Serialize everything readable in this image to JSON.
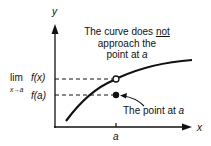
{
  "diagram": {
    "axes": {
      "x_label": "x",
      "y_label": "y"
    },
    "x_tick_label": "a",
    "limit_label": {
      "lim": "lim",
      "sub": "x→a",
      "fx": "f(x)"
    },
    "fa_label": "f(a)",
    "annotation_top": {
      "line1_pre": "The curve does ",
      "line1_emph": "not",
      "line2": "approach the",
      "line3_pre": "point at ",
      "line3_var": "a"
    },
    "annotation_bottom": {
      "text_pre": "The point at ",
      "text_var": "a"
    },
    "points": [
      {
        "name": "limit-point",
        "style": "open-circle",
        "x": "a",
        "y": "lim f(x)"
      },
      {
        "name": "function-value-point",
        "style": "filled-circle",
        "x": "a",
        "y": "f(a)"
      }
    ],
    "colors": {
      "ink": "#111111",
      "background": "#ffffff"
    }
  }
}
